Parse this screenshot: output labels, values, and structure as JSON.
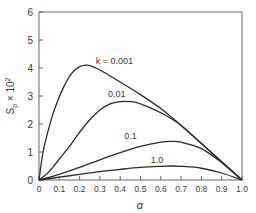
{
  "chart_data": {
    "type": "line",
    "title": "",
    "xlabel": "α",
    "ylabel": "S_p × 10^2",
    "ylabel_main": "S",
    "ylabel_sub": "p",
    "ylabel_tail": " × 10",
    "ylabel_sup": "2",
    "xlim": [
      0,
      1.0
    ],
    "ylim": [
      0,
      6
    ],
    "grid": false,
    "legend": "inline labels on curves",
    "x_ticks": [
      "0",
      "0.1",
      "0.2",
      "0.3",
      "0.4",
      "0.5",
      "0.6",
      "0.7",
      "0.8",
      "0.9",
      "1.0"
    ],
    "y_ticks": [
      "0",
      "1",
      "2",
      "3",
      "4",
      "5",
      "6"
    ],
    "series": [
      {
        "name": "k = 0.001",
        "label": "k = 0.001",
        "x": [
          0,
          0.02,
          0.05,
          0.08,
          0.12,
          0.16,
          0.2,
          0.24,
          0.28,
          0.32,
          0.4,
          0.5,
          0.6,
          0.7,
          0.8,
          0.9,
          1.0
        ],
        "y": [
          0,
          1.0,
          1.9,
          2.6,
          3.3,
          3.8,
          4.05,
          4.1,
          4.0,
          3.85,
          3.5,
          3.05,
          2.55,
          1.95,
          1.3,
          0.65,
          0
        ]
      },
      {
        "name": "k = 0.01",
        "label": "0.01",
        "x": [
          0,
          0.05,
          0.1,
          0.15,
          0.2,
          0.25,
          0.3,
          0.35,
          0.4,
          0.45,
          0.5,
          0.6,
          0.7,
          0.8,
          0.9,
          1.0
        ],
        "y": [
          0,
          0.3,
          0.75,
          1.2,
          1.7,
          2.15,
          2.5,
          2.72,
          2.8,
          2.8,
          2.72,
          2.4,
          1.95,
          1.3,
          0.65,
          0
        ]
      },
      {
        "name": "k = 0.1",
        "label": "0.1",
        "x": [
          0,
          0.1,
          0.2,
          0.3,
          0.4,
          0.5,
          0.6,
          0.65,
          0.7,
          0.8,
          0.9,
          1.0
        ],
        "y": [
          0,
          0.2,
          0.45,
          0.72,
          0.98,
          1.2,
          1.35,
          1.38,
          1.35,
          1.12,
          0.62,
          0
        ]
      },
      {
        "name": "k = 1.0",
        "label": "1.0",
        "x": [
          0,
          0.1,
          0.2,
          0.3,
          0.4,
          0.5,
          0.6,
          0.65,
          0.7,
          0.8,
          0.9,
          1.0
        ],
        "y": [
          0,
          0.1,
          0.2,
          0.3,
          0.38,
          0.45,
          0.49,
          0.5,
          0.49,
          0.42,
          0.25,
          0
        ]
      }
    ],
    "annotations": [
      {
        "text": "k = 0.001",
        "x": 0.28,
        "y": 4.15
      },
      {
        "text": "0.01",
        "x": 0.34,
        "y": 2.95
      },
      {
        "text": "0.1",
        "x": 0.42,
        "y": 1.45
      },
      {
        "text": "1.0",
        "x": 0.55,
        "y": 0.6
      }
    ],
    "colors": {
      "line": "#2a2a2a",
      "axis": "#555555",
      "text": "#3a3a3a"
    }
  }
}
